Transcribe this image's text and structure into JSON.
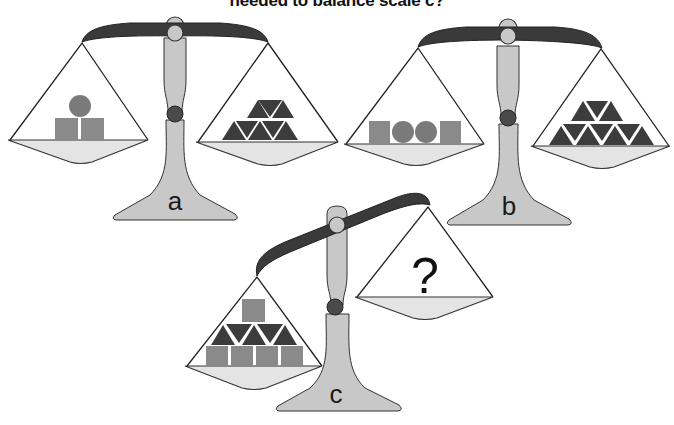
{
  "title": "needed to balance scale c?",
  "colors": {
    "beam": "#3a3a3a",
    "post": "#c8c8c8",
    "pan": "#e4e4e4",
    "node": "#4a4a4a",
    "square": "#8a8a8a",
    "circle": "#7a7a7a",
    "triangle": "#3c3c3c",
    "outline": "#222222"
  },
  "scales": [
    {
      "label": "a",
      "state": "balanced",
      "left_pan": {
        "items": [
          {
            "shape": "circle",
            "count": 1
          },
          {
            "shape": "square",
            "count": 2
          }
        ]
      },
      "right_pan": {
        "items": [
          {
            "shape": "triangle",
            "count": 8
          }
        ]
      }
    },
    {
      "label": "b",
      "state": "balanced",
      "left_pan": {
        "items": [
          {
            "shape": "square",
            "count": 2
          },
          {
            "shape": "circle",
            "count": 2
          }
        ]
      },
      "right_pan": {
        "items": [
          {
            "shape": "triangle",
            "count": 10
          }
        ]
      }
    },
    {
      "label": "c",
      "state": "unbalanced (left heavier)",
      "left_pan": {
        "items": [
          {
            "shape": "square",
            "count": 5
          },
          {
            "shape": "triangle",
            "count": 5
          }
        ]
      },
      "right_pan": {
        "items": [
          {
            "shape": "unknown",
            "symbol": "?"
          }
        ]
      }
    }
  ]
}
